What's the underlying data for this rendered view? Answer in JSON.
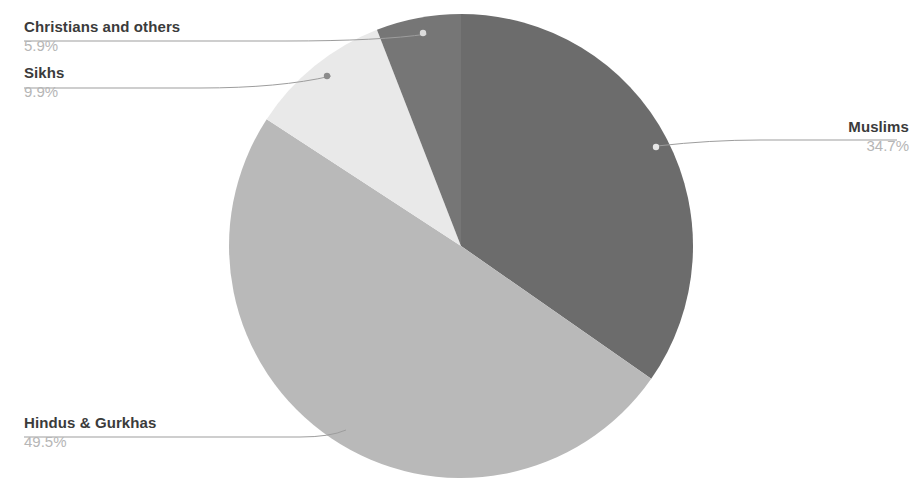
{
  "chart_data": {
    "type": "pie",
    "title": "",
    "subtitle": "",
    "xlabel": "",
    "ylabel": "",
    "legend_position": "callout-labels",
    "grid": false,
    "start_angle_deg": 0,
    "direction": "clockwise",
    "categories": [
      "Muslims",
      "Hindus & Gurkhas",
      "Sikhs",
      "Christians and others"
    ],
    "values": [
      34.7,
      49.5,
      9.9,
      5.9
    ],
    "value_suffix": "%",
    "slices": [
      {
        "label": "Muslims",
        "value": 34.7,
        "value_label": "34.7%",
        "color": "#6c6c6c"
      },
      {
        "label": "Hindus & Gurkhas",
        "value": 49.5,
        "value_label": "49.5%",
        "color": "#b9b9b9"
      },
      {
        "label": "Sikhs",
        "value": 9.9,
        "value_label": "9.9%",
        "color": "#e9e9e9"
      },
      {
        "label": "Christians and others",
        "value": 5.9,
        "value_label": "5.9%",
        "color": "#767676"
      }
    ]
  },
  "callouts": {
    "christians": {
      "title": "Christians and others",
      "value": "5.9%"
    },
    "sikhs": {
      "title": "Sikhs",
      "value": "9.9%"
    },
    "hindus": {
      "title": "Hindus & Gurkhas",
      "value": "49.5%"
    },
    "muslims": {
      "title": "Muslims",
      "value": "34.7%"
    }
  },
  "colors": {
    "background": "#ffffff",
    "title_text": "#3b3b3b",
    "value_text": "#b6b6b6",
    "leader_line": "#9a9a9a",
    "muslims": "#6c6c6c",
    "hindus": "#b9b9b9",
    "sikhs": "#e9e9e9",
    "christians": "#767676"
  }
}
